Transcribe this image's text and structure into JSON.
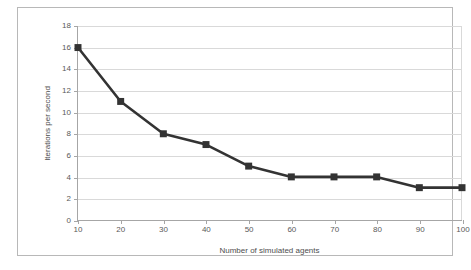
{
  "chart_data": {
    "type": "line",
    "title": "",
    "subtitle": "",
    "xlabel": "Number of simulated agents",
    "ylabel": "Iterations per second",
    "x": [
      10,
      20,
      30,
      40,
      50,
      60,
      70,
      80,
      90,
      100
    ],
    "values": [
      16,
      11,
      8,
      7,
      5,
      4,
      4,
      4,
      3,
      3
    ],
    "series": [
      {
        "name": "Iterations per second",
        "values": [
          16,
          11,
          8,
          7,
          5,
          4,
          4,
          4,
          3,
          3
        ]
      }
    ],
    "xlim": [
      10,
      100
    ],
    "ylim": [
      0,
      18
    ],
    "xticks": [
      10,
      20,
      30,
      40,
      50,
      60,
      70,
      80,
      90,
      100
    ],
    "yticks": [
      0,
      2,
      4,
      6,
      8,
      10,
      12,
      14,
      16,
      18
    ],
    "xtick_labels": [
      "10",
      "20",
      "30",
      "40",
      "50",
      "60",
      "70",
      "80",
      "90",
      "100"
    ],
    "ytick_labels": [
      "0",
      "2",
      "4",
      "6",
      "8",
      "10",
      "12",
      "14",
      "16",
      "18"
    ],
    "grid": {
      "horizontal": true,
      "vertical": false
    },
    "legend": {
      "visible": false,
      "position": "none",
      "entries": []
    },
    "marker": "square",
    "annotations": []
  },
  "style": {
    "line_color": "#333333",
    "marker_color": "#333333",
    "grid_color": "#d9d9d9",
    "axis_color": "#a6a6a6",
    "tick_label_color": "#595959",
    "axis_title_color": "#4d4d4d",
    "frame_color": "#b8b8b8",
    "background": "#ffffff"
  }
}
